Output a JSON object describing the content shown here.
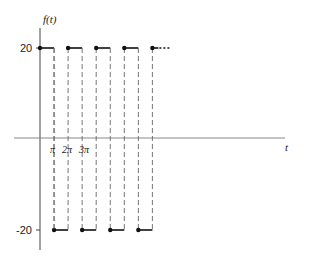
{
  "chart_data": {
    "type": "line",
    "title": "",
    "ylabel": "f(t)",
    "xlabel": "t",
    "y_ticks": [
      20,
      -20
    ],
    "x_tick_labels": [
      "π",
      "2π",
      "3π"
    ],
    "ylim": [
      -20,
      20
    ],
    "grid": false,
    "legend": "none",
    "series": [
      {
        "name": "f(t)",
        "segments": [
          {
            "t_start": 0,
            "t_end": 1,
            "value": 20
          },
          {
            "t_start": 1,
            "t_end": 2,
            "value": -20
          },
          {
            "t_start": 2,
            "t_end": 3,
            "value": 20
          },
          {
            "t_start": 3,
            "t_end": 4,
            "value": -20
          },
          {
            "t_start": 4,
            "t_end": 5,
            "value": 20
          },
          {
            "t_start": 5,
            "t_end": 6,
            "value": -20
          },
          {
            "t_start": 6,
            "t_end": 7,
            "value": 20
          },
          {
            "t_start": 7,
            "t_end": 8,
            "value": -20
          },
          {
            "t_start": 8,
            "t_end": 9,
            "value": 20
          }
        ],
        "t_unit": "π"
      }
    ]
  },
  "labels": {
    "y_axis": "f(t)",
    "x_axis": "t",
    "y_top": "20",
    "y_bottom": "-20",
    "x_pi": "π",
    "x_2pi": "2π",
    "x_3pi": "3π",
    "continuation": "..."
  }
}
